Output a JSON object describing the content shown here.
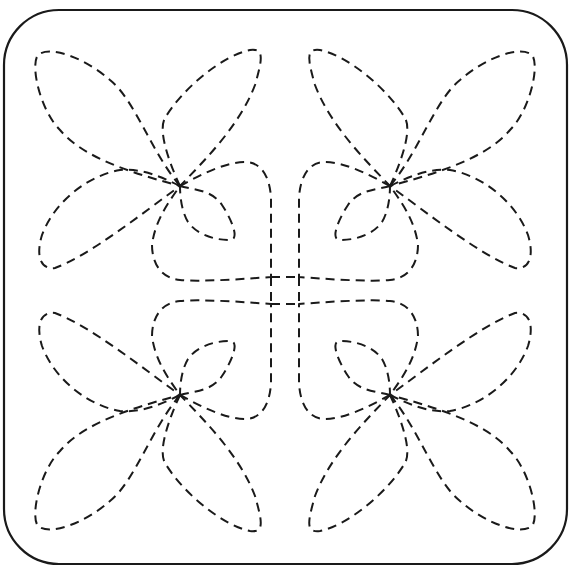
{
  "pattern": {
    "type": "quilting stitch pattern",
    "description": "Square block with rounded corners containing four mirrored dashed-line flower motifs joined by a woven center square",
    "line_color": "#1a1a1a",
    "background_color": "#ffffff",
    "border": {
      "x": 4,
      "y": 10,
      "width": 563,
      "height": 554,
      "corner_radius": 55,
      "style": "solid"
    },
    "stitch_style": "dashed",
    "dash": {
      "length": 9,
      "gap": 6,
      "width": 2
    },
    "center_square": {
      "x_lines": [
        271,
        299
      ],
      "y_lines": [
        277,
        304
      ]
    },
    "motifs": [
      {
        "id": "flower-top-left",
        "center": [
          180,
          186
        ]
      },
      {
        "id": "flower-top-right",
        "center": [
          390,
          186
        ]
      },
      {
        "id": "flower-bottom-left",
        "center": [
          180,
          395
        ]
      },
      {
        "id": "flower-bottom-right",
        "center": [
          390,
          395
        ]
      }
    ]
  }
}
